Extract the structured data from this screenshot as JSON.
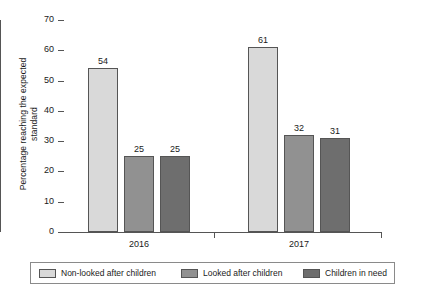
{
  "chart_data": {
    "type": "bar",
    "title": "",
    "subtitle": "",
    "xlabel": "",
    "ylabel": "Percentage reaching the expected\nstandard",
    "categories": [
      "2016",
      "2017"
    ],
    "series": [
      {
        "name": "Non-looked after children",
        "color": "#d9d9d9",
        "values": [
          54,
          61
        ]
      },
      {
        "name": "Looked after children",
        "color": "#919191",
        "values": [
          25,
          32
        ]
      },
      {
        "name": "Children in need",
        "color": "#6e6e6e",
        "values": [
          25,
          31
        ]
      }
    ],
    "ylim": [
      0,
      70
    ],
    "ytick_labels": [
      "70",
      "60",
      "50",
      "40",
      "30",
      "20",
      "10",
      "0"
    ],
    "ytick_values": [
      70,
      60,
      50,
      40,
      30,
      20,
      10,
      0
    ],
    "grid": false,
    "legend_position": "bottom",
    "value_labels": [
      {
        "group": "2016",
        "series": "Non-looked after children",
        "value": "54"
      },
      {
        "group": "2016",
        "series": "Looked after children",
        "value": "25"
      },
      {
        "group": "2016",
        "series": "Children in need",
        "value": "25"
      },
      {
        "group": "2017",
        "series": "Non-looked after children",
        "value": "61"
      },
      {
        "group": "2017",
        "series": "Looked after children",
        "value": "32"
      },
      {
        "group": "2017",
        "series": "Children in need",
        "value": "31"
      }
    ]
  },
  "legend": {
    "items": [
      {
        "label": "Non-looked after children",
        "color": "#d9d9d9"
      },
      {
        "label": "Looked after children",
        "color": "#919191"
      },
      {
        "label": "Children in need",
        "color": "#6e6e6e"
      }
    ]
  },
  "axes": {
    "y_title": "Percentage reaching the expected\nstandard",
    "y_ticks": [
      "70",
      "60",
      "50",
      "40",
      "30",
      "20",
      "10",
      "0"
    ],
    "x_groups": [
      "2016",
      "2017"
    ]
  },
  "colors": {
    "axis": "#555555",
    "text": "#1a1a1a",
    "background": "#ffffff",
    "legend_border": "#8a8a8a"
  }
}
